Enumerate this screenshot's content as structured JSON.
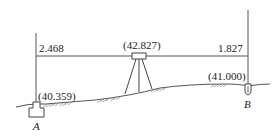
{
  "diagram": {
    "type": "leveling-survey",
    "instrument": {
      "elevation_label": "(42.827)",
      "icon": "level-instrument-tripod-icon"
    },
    "backsight": {
      "reading": "2.468"
    },
    "foresight": {
      "reading": "1.827"
    },
    "points": [
      {
        "name": "A",
        "elevation_label": "(40.359)",
        "marker": "benchmark-block-icon"
      },
      {
        "name": "B",
        "elevation_label": "(41.000)",
        "marker": "stake-icon"
      }
    ],
    "colors": {
      "line": "#555555",
      "text": "#222222",
      "background": "#ffffff"
    }
  }
}
